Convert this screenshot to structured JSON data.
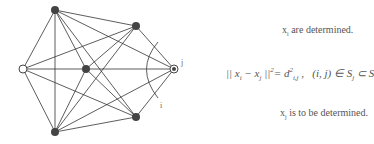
{
  "diagram": {
    "nodes": [
      {
        "id": "n1",
        "x": 55,
        "y": 10,
        "filled": true
      },
      {
        "id": "n2",
        "x": 136,
        "y": 26,
        "filled": true
      },
      {
        "id": "n3",
        "x": 23,
        "y": 69,
        "filled": false
      },
      {
        "id": "n4",
        "x": 86,
        "y": 69,
        "filled": true
      },
      {
        "id": "j",
        "x": 174,
        "y": 69,
        "filled": false
      },
      {
        "id": "n6",
        "x": 136,
        "y": 117,
        "filled": true
      },
      {
        "id": "n7",
        "x": 55,
        "y": 132,
        "filled": true
      }
    ],
    "label_j": "j",
    "label_i": "i"
  },
  "text": {
    "determined": "xi are determined.",
    "equation": "|| xi − xj ||² = d²i,j ,   (i, j) ∈ Sj ⊂ S",
    "to_determine": "xj is to be determined."
  }
}
